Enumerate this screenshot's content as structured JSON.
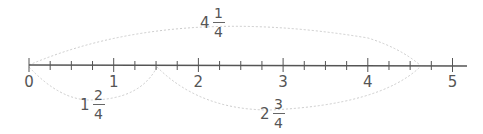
{
  "number_line": {
    "start": 0,
    "end": 5,
    "subdivisions_per_unit": 4,
    "labels": [
      "0",
      "1",
      "2",
      "3",
      "4",
      "5"
    ],
    "line_color": "#555555",
    "arc_color": "#c8c8c8"
  },
  "arcs": [
    {
      "from": 0,
      "to": 4.25,
      "side": "above",
      "label": {
        "whole": "4",
        "num": "1",
        "den": "4"
      }
    },
    {
      "from": 0,
      "to": 1.5,
      "side": "below",
      "label": {
        "whole": "1",
        "num": "2",
        "den": "4"
      }
    },
    {
      "from": 1.5,
      "to": 4.25,
      "side": "below",
      "label": {
        "whole": "2",
        "num": "3",
        "den": "4"
      }
    }
  ]
}
